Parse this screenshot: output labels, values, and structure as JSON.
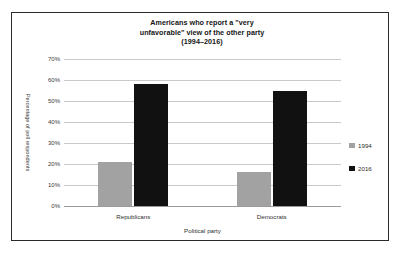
{
  "figure": {
    "border_color": "#2b2b2b",
    "background": "#ffffff"
  },
  "chart_data": {
    "type": "bar",
    "title": "Americans who report a \"very unfavorable\" view of the other party (1994–2016)",
    "title_lines": [
      "Americans who report a \"very",
      "unfavorable\" view of the other party",
      "(1994–2016)"
    ],
    "xlabel": "Political party",
    "ylabel": "Percentage of poll respondents",
    "categories": [
      "Republicans",
      "Democrats"
    ],
    "series": [
      {
        "name": "1994",
        "color": "#a2a2a2",
        "values": [
          21,
          16
        ]
      },
      {
        "name": "2016",
        "color": "#111111",
        "values": [
          58,
          55
        ]
      }
    ],
    "ylim": [
      0,
      70
    ],
    "ytick_values": [
      0,
      10,
      20,
      30,
      40,
      50,
      60,
      70
    ],
    "ytick_labels": [
      "0%",
      "10%",
      "20%",
      "30%",
      "40%",
      "50%",
      "60%",
      "70%"
    ],
    "grid": true,
    "grid_color": "#c9c9c9",
    "legend_position": "right"
  }
}
